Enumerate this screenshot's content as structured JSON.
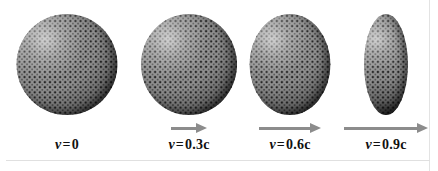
{
  "figure": {
    "background_color": "#ffffff",
    "rule_color": "#e0e0e0",
    "arrow_color": "#8c8c8c",
    "text_color": "#111111",
    "sphere_base_color": "#9a9a9a",
    "sphere_dot_color": "#1d1d1d"
  },
  "panels": [
    {
      "id": "panel-0",
      "speed_symbol": "v",
      "equals": "=",
      "speed_value": "0",
      "caption": "v = 0",
      "has_arrow": false,
      "arrow_length_px": 0,
      "sphere_width_px": 101,
      "sphere_height_px": 101,
      "contraction_factor": 1.0,
      "center_x_px": 67
    },
    {
      "id": "panel-1",
      "speed_symbol": "v",
      "equals": "=",
      "speed_value": "0.3c",
      "caption": "v = 0.3c",
      "has_arrow": true,
      "arrow_length_px": 36,
      "sphere_width_px": 96,
      "sphere_height_px": 101,
      "contraction_factor": 0.954,
      "center_x_px": 189
    },
    {
      "id": "panel-2",
      "speed_symbol": "v",
      "equals": "=",
      "speed_value": "0.6c",
      "caption": "v = 0.6c",
      "has_arrow": true,
      "arrow_length_px": 62,
      "sphere_width_px": 81,
      "sphere_height_px": 101,
      "contraction_factor": 0.8,
      "center_x_px": 288
    },
    {
      "id": "panel-3",
      "speed_symbol": "v",
      "equals": "=",
      "speed_value": "0.9c",
      "caption": "v = 0.9c",
      "has_arrow": true,
      "arrow_length_px": 84,
      "sphere_width_px": 44,
      "sphere_height_px": 101,
      "contraction_factor": 0.436,
      "center_x_px": 386
    }
  ]
}
